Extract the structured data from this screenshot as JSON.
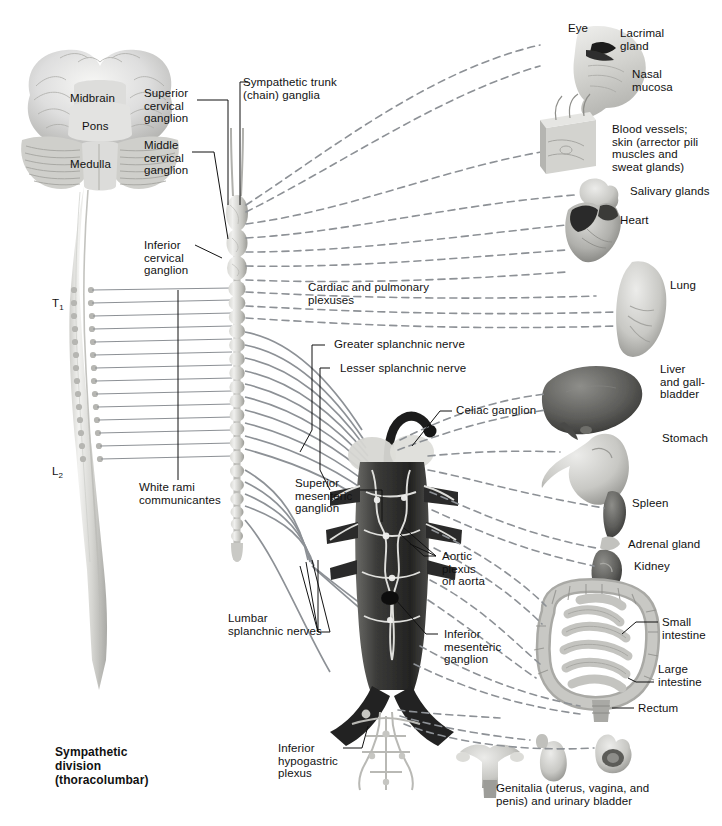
{
  "figure": {
    "title": "Sympathetic\ndivision\n(thoracolumbar)",
    "background": "#ffffff",
    "line_colors": {
      "postganglionic_dashed": "#8d9196",
      "preganglionic_solid": "#8d9196",
      "leader": "#111111"
    }
  },
  "brain_labels": {
    "midbrain": "Midbrain",
    "pons": "Pons",
    "medulla": "Medulla"
  },
  "spinal_levels": {
    "t1": "T",
    "t1_sub": "1",
    "l2": "L",
    "l2_sub": "2"
  },
  "center_labels": {
    "superior_cervical_ganglion": "Superior\ncervical\nganglion",
    "sympathetic_trunk": "Sympathetic trunk\n(chain) ganglia",
    "middle_cervical_ganglion": "Middle\ncervical\nganglion",
    "inferior_cervical_ganglion": "Inferior\ncervical\nganglion",
    "cardiac_pulmonary_plexuses": "Cardiac and pulmonary\nplexuses",
    "greater_splanchnic": "Greater splanchnic nerve",
    "lesser_splanchnic": "Lesser splanchnic nerve",
    "celiac_ganglion": "Celiac ganglion",
    "white_rami": "White rami\ncommunicantes",
    "superior_mesenteric_ganglion": "Superior\nmesenteric\nganglion",
    "aortic_plexus": "Aortic\nplexus\non aorta",
    "lumbar_splanchnic": "Lumbar\nsplanchnic nerves",
    "inferior_mesenteric_ganglion": "Inferior\nmesenteric\nganglion",
    "inferior_hypogastric_plexus": "Inferior\nhypogastric\nplexus"
  },
  "organ_labels": {
    "eye": "Eye",
    "lacrimal_gland": "Lacrimal\ngland",
    "nasal_mucosa": "Nasal\nmucosa",
    "blood_vessels_skin": "Blood vessels;\nskin (arrector pili\nmuscles and\nsweat glands)",
    "salivary_glands": "Salivary glands",
    "heart": "Heart",
    "lung": "Lung",
    "liver_gallbladder": "Liver\nand gall-\nbladder",
    "stomach": "Stomach",
    "spleen": "Spleen",
    "adrenal_gland": "Adrenal gland",
    "kidney": "Kidney",
    "small_intestine": "Small\nintestine",
    "large_intestine": "Large\nintestine",
    "rectum": "Rectum",
    "genitalia": "Genitalia (uterus, vagina, and\npenis) and urinary bladder"
  }
}
